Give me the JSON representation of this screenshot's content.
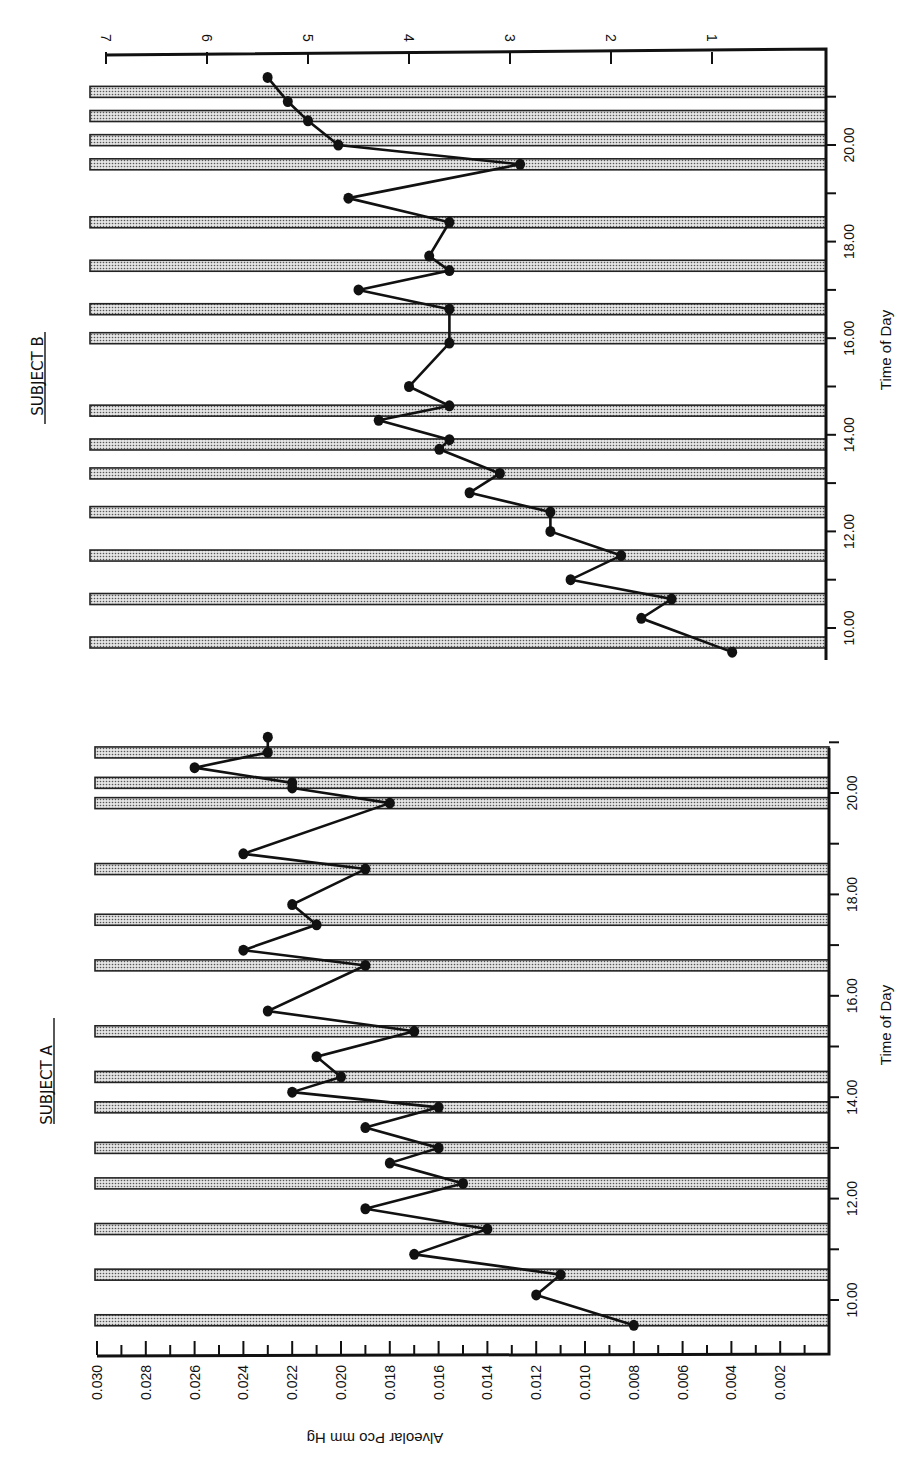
{
  "chart_data": [
    {
      "type": "line",
      "title": "SUBJECT A",
      "xlabel": "Time of Day",
      "ylabel": "Alveolar Pco mm Hg",
      "x_ticks": [
        "10.00",
        "12.00",
        "14.00",
        "16.00",
        "18.00",
        "20.00"
      ],
      "y_ticks": [
        "0.030",
        "0.028",
        "0.026",
        "0.024",
        "0.022",
        "0.020",
        "0.018",
        "0.016",
        "0.014",
        "0.012",
        "0.010",
        "0.008",
        "0.006",
        "0.004",
        "0.002"
      ],
      "ylim": [
        0,
        0.03
      ],
      "xlim": [
        9.0,
        21.1
      ],
      "orientation": "rotated 90° (time axis vertical, value axis horizontal)",
      "shaded_periods": [
        9.6,
        10.5,
        11.4,
        12.3,
        13.0,
        13.8,
        14.4,
        15.3,
        16.6,
        17.5,
        18.5,
        19.8,
        20.2,
        20.8
      ],
      "series": [
        {
          "name": "Subject A",
          "x": [
            9.5,
            10.1,
            10.5,
            10.9,
            11.4,
            11.8,
            12.3,
            12.7,
            13.0,
            13.4,
            13.8,
            14.1,
            14.4,
            14.8,
            15.3,
            15.7,
            16.6,
            16.9,
            17.4,
            17.8,
            18.5,
            18.8,
            19.8,
            20.1,
            20.2,
            20.5,
            20.8,
            21.1
          ],
          "values": [
            0.008,
            0.012,
            0.011,
            0.017,
            0.014,
            0.019,
            0.015,
            0.018,
            0.016,
            0.019,
            0.016,
            0.022,
            0.02,
            0.021,
            0.017,
            0.023,
            0.019,
            0.024,
            0.021,
            0.022,
            0.019,
            0.024,
            0.018,
            0.022,
            0.022,
            0.026,
            0.023,
            0.023
          ]
        }
      ],
      "grid": false
    },
    {
      "type": "line",
      "title": "SUBJECT B",
      "xlabel": "Time of Day",
      "ylabel": "",
      "x_ticks": [
        "10.00",
        "12.00",
        "14.00",
        "16.00",
        "18.00",
        "20.00"
      ],
      "y_ticks": [
        "7",
        "6",
        "5",
        "4",
        "3",
        "2",
        "1"
      ],
      "ylim": [
        0,
        7
      ],
      "xlim": [
        9.3,
        21.8
      ],
      "orientation": "rotated 90° (time axis vertical, value axis horizontal)",
      "shaded_periods": [
        9.7,
        10.6,
        11.5,
        12.4,
        13.2,
        13.8,
        14.5,
        16.0,
        16.6,
        17.5,
        18.4,
        19.6,
        20.1,
        20.6,
        21.1
      ],
      "series": [
        {
          "name": "Subject B",
          "x": [
            9.5,
            10.2,
            10.6,
            11.0,
            11.5,
            12.0,
            12.4,
            12.8,
            13.2,
            13.7,
            13.9,
            14.3,
            14.6,
            15.0,
            15.9,
            16.6,
            17.0,
            17.4,
            17.7,
            18.4,
            18.9,
            19.6,
            20.0,
            20.5,
            20.9,
            21.4
          ],
          "values": [
            0.8,
            1.7,
            1.4,
            2.4,
            1.9,
            2.6,
            2.6,
            3.4,
            3.1,
            3.7,
            3.6,
            4.3,
            3.6,
            4.0,
            3.6,
            3.6,
            4.5,
            3.6,
            3.8,
            3.6,
            4.6,
            2.9,
            4.7,
            5.0,
            5.2,
            5.4
          ]
        }
      ],
      "grid": false
    }
  ],
  "panels": {
    "a": {
      "title": "SUBJECT A",
      "xlabel": "Time of Day",
      "ylabel": "Alveolar Pco mm Hg",
      "x_tick_labels": [
        "10.00",
        "12.00",
        "14.00",
        "16.00",
        "18.00",
        "20.00"
      ],
      "y_tick_labels": [
        "0.030",
        "0.028",
        "0.026",
        "0.024",
        "0.022",
        "0.020",
        "0.018",
        "0.016",
        "0.014",
        "0.012",
        "0.010",
        "0.008",
        "0.006",
        "0.004",
        "0.002"
      ]
    },
    "b": {
      "title": "SUBJECT B",
      "xlabel": "Time of Day",
      "x_tick_labels": [
        "10.00",
        "12.00",
        "14.00",
        "16.00",
        "18.00",
        "20.00"
      ],
      "y_tick_labels": [
        "7",
        "6",
        "5",
        "4",
        "3",
        "2",
        "1"
      ]
    }
  }
}
